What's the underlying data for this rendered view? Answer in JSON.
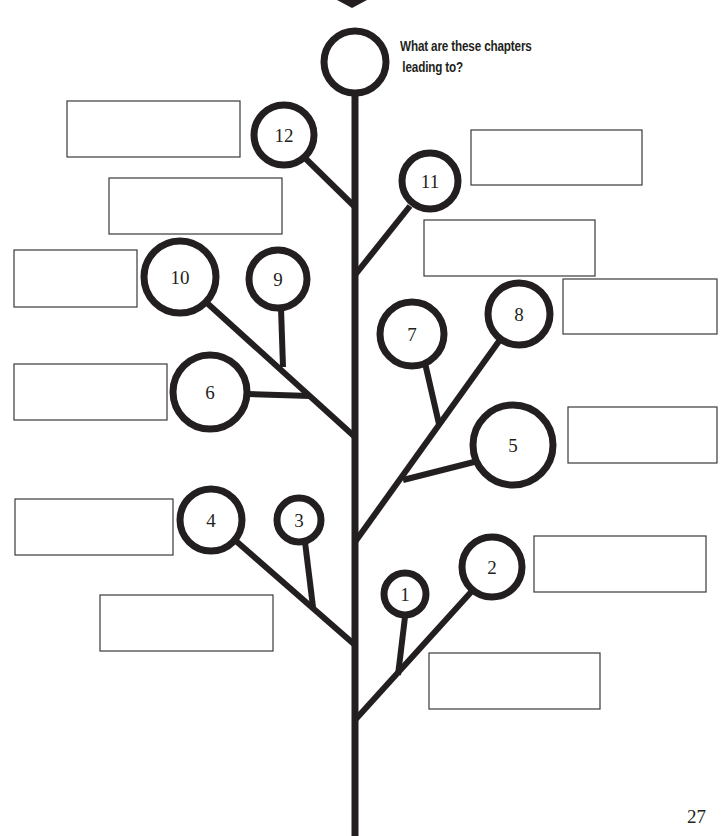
{
  "worksheet": {
    "question_line1": "What are these chapters",
    "question_line2": "leading to?",
    "page_number": "27"
  },
  "tree": {
    "ink_color": "#231f20",
    "top_marker": {
      "points": "337,0 367,0 352,8"
    },
    "trunk": {
      "x1": 355,
      "y1": 95,
      "x2": 355,
      "y2": 836,
      "width": 7
    },
    "top_node": {
      "cx": 355,
      "cy": 62,
      "r": 31,
      "stroke": 7
    },
    "branches": [
      {
        "id": "b12",
        "x1": 305,
        "y1": 158,
        "x2": 355,
        "y2": 207,
        "width": 6
      },
      {
        "id": "b11",
        "x1": 410,
        "y1": 206,
        "x2": 355,
        "y2": 275,
        "width": 6
      },
      {
        "id": "b10",
        "x1": 207,
        "y1": 303,
        "x2": 355,
        "y2": 437,
        "width": 6
      },
      {
        "id": "b9",
        "x1": 281,
        "y1": 308,
        "x2": 283,
        "y2": 367,
        "width": 6
      },
      {
        "id": "b6",
        "x1": 247,
        "y1": 394,
        "x2": 310,
        "y2": 396,
        "width": 6
      },
      {
        "id": "b8",
        "x1": 502,
        "y1": 337,
        "x2": 355,
        "y2": 542,
        "width": 6
      },
      {
        "id": "b7",
        "x1": 425,
        "y1": 363,
        "x2": 439,
        "y2": 424,
        "width": 6
      },
      {
        "id": "b5",
        "x1": 478,
        "y1": 461,
        "x2": 403,
        "y2": 480,
        "width": 6
      },
      {
        "id": "b4",
        "x1": 236,
        "y1": 541,
        "x2": 355,
        "y2": 645,
        "width": 6
      },
      {
        "id": "b3",
        "x1": 305,
        "y1": 542,
        "x2": 313,
        "y2": 607,
        "width": 6
      },
      {
        "id": "b2",
        "x1": 472,
        "y1": 591,
        "x2": 355,
        "y2": 720,
        "width": 6
      },
      {
        "id": "b1",
        "x1": 405,
        "y1": 617,
        "x2": 398,
        "y2": 675,
        "width": 6
      }
    ],
    "nodes": [
      {
        "number": "12",
        "cx": 284,
        "cy": 135,
        "r": 30,
        "stroke": 7
      },
      {
        "number": "11",
        "cx": 430,
        "cy": 181,
        "r": 28,
        "stroke": 7
      },
      {
        "number": "10",
        "cx": 180,
        "cy": 277,
        "r": 36,
        "stroke": 7
      },
      {
        "number": "9",
        "cx": 278,
        "cy": 279,
        "r": 29,
        "stroke": 7
      },
      {
        "number": "6",
        "cx": 210,
        "cy": 392,
        "r": 37,
        "stroke": 7
      },
      {
        "number": "7",
        "cx": 412,
        "cy": 334,
        "r": 32,
        "stroke": 7
      },
      {
        "number": "8",
        "cx": 519,
        "cy": 314,
        "r": 31,
        "stroke": 7
      },
      {
        "number": "5",
        "cx": 513,
        "cy": 445,
        "r": 40,
        "stroke": 7
      },
      {
        "number": "4",
        "cx": 211,
        "cy": 520,
        "r": 31,
        "stroke": 7
      },
      {
        "number": "3",
        "cx": 299,
        "cy": 520,
        "r": 22,
        "stroke": 7
      },
      {
        "number": "1",
        "cx": 405,
        "cy": 594,
        "r": 21,
        "stroke": 7
      },
      {
        "number": "2",
        "cx": 492,
        "cy": 567,
        "r": 30,
        "stroke": 7
      }
    ],
    "answer_boxes": [
      {
        "for": "12",
        "x": 67,
        "y": 101,
        "w": 173,
        "h": 56,
        "value": ""
      },
      {
        "for": "11",
        "x": 471,
        "y": 130,
        "w": 171,
        "h": 55,
        "value": ""
      },
      {
        "for": "top-right-mid",
        "x": 109,
        "y": 178,
        "w": 173,
        "h": 56,
        "value": ""
      },
      {
        "for": "10",
        "x": 14,
        "y": 250,
        "w": 123,
        "h": 57,
        "value": ""
      },
      {
        "for": "9-right",
        "x": 424,
        "y": 220,
        "w": 171,
        "h": 56,
        "value": ""
      },
      {
        "for": "8",
        "x": 563,
        "y": 279,
        "w": 154,
        "h": 55,
        "value": ""
      },
      {
        "for": "6",
        "x": 14,
        "y": 364,
        "w": 153,
        "h": 56,
        "value": ""
      },
      {
        "for": "5",
        "x": 568,
        "y": 407,
        "w": 149,
        "h": 56,
        "value": ""
      },
      {
        "for": "4",
        "x": 15,
        "y": 499,
        "w": 158,
        "h": 56,
        "value": ""
      },
      {
        "for": "2",
        "x": 534,
        "y": 536,
        "w": 172,
        "h": 56,
        "value": ""
      },
      {
        "for": "3",
        "x": 100,
        "y": 595,
        "w": 173,
        "h": 56,
        "value": ""
      },
      {
        "for": "1",
        "x": 429,
        "y": 653,
        "w": 171,
        "h": 56,
        "value": ""
      }
    ]
  }
}
